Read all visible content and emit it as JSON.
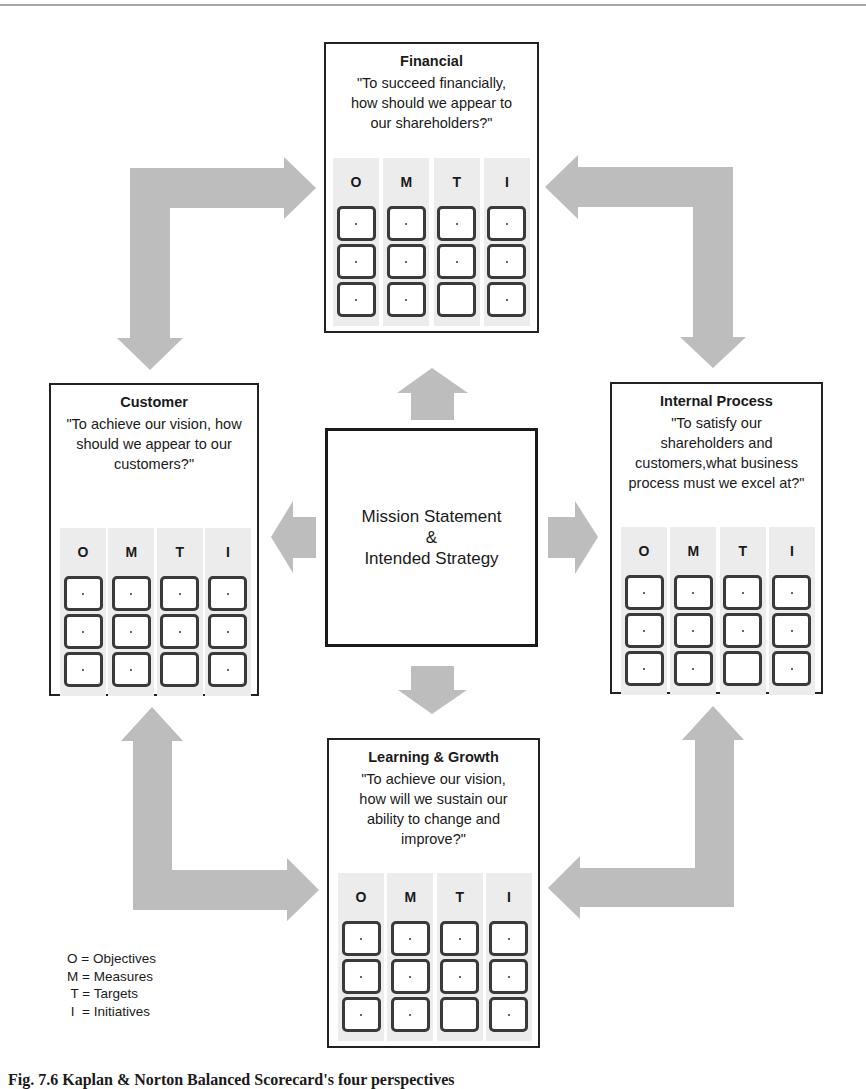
{
  "colors": {
    "arrow": "#bdbdbd",
    "column_bg": "#ececec",
    "border": "#222222",
    "cell_border": "#3a3a3a"
  },
  "mission": {
    "line1": "Mission Statement",
    "line2": "&",
    "line3": "Intended Strategy"
  },
  "perspectives": {
    "financial": {
      "title": "Financial",
      "question": [
        "\"To succeed financially,",
        "how should we appear to",
        "our shareholders?\""
      ],
      "columns": [
        "O",
        "M",
        "T",
        "I"
      ],
      "cells": [
        [
          ".",
          ".",
          ".",
          "."
        ],
        [
          ".",
          ".",
          ".",
          "."
        ],
        [
          ".",
          ".",
          "",
          "."
        ]
      ]
    },
    "customer": {
      "title": "Customer",
      "question": [
        "\"To achieve our vision, how",
        "should we appear to our",
        "customers?\""
      ],
      "columns": [
        "O",
        "M",
        "T",
        "I"
      ],
      "cells": [
        [
          ".",
          ".",
          ".",
          "."
        ],
        [
          ".",
          ".",
          ".",
          "."
        ],
        [
          ".",
          ".",
          "",
          "."
        ]
      ]
    },
    "internal": {
      "title": "Internal Process",
      "question": [
        "\"To satisfy our",
        "shareholders and",
        "customers,what business",
        "process must we excel at?\""
      ],
      "columns": [
        "O",
        "M",
        "T",
        "I"
      ],
      "cells": [
        [
          ".",
          ".",
          ".",
          "."
        ],
        [
          ".",
          ".",
          ".",
          "."
        ],
        [
          ".",
          ".",
          "",
          "."
        ]
      ]
    },
    "learning": {
      "title": "Learning & Growth",
      "question": [
        "\"To achieve our vision,",
        "how will we sustain our",
        "ability to change and",
        "improve?\""
      ],
      "columns": [
        "O",
        "M",
        "T",
        "I"
      ],
      "cells": [
        [
          ".",
          ".",
          ".",
          "."
        ],
        [
          ".",
          ".",
          ".",
          "."
        ],
        [
          ".",
          ".",
          "",
          "."
        ]
      ]
    }
  },
  "legend": [
    "O = Objectives",
    "M = Measures",
    " T = Targets",
    " I  = Initiatives"
  ],
  "caption": "Fig. 7.6  Kaplan & Norton Balanced Scorecard's four perspectives"
}
